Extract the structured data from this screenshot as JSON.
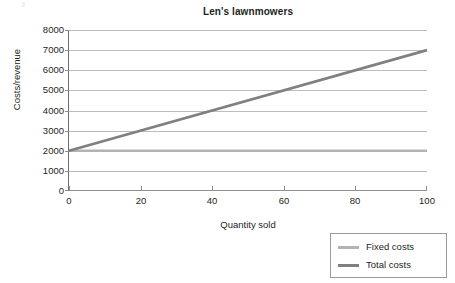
{
  "chart_data": {
    "type": "line",
    "title": "Len's lawnmowers",
    "xlabel": "Quantity sold",
    "ylabel": "Costs/revenue",
    "xlim": [
      0,
      100
    ],
    "ylim": [
      0,
      8000
    ],
    "xticks": [
      0,
      20,
      40,
      60,
      80,
      100
    ],
    "yticks": [
      0,
      1000,
      2000,
      3000,
      4000,
      5000,
      6000,
      7000,
      8000
    ],
    "xtick_labels": [
      "0",
      "20",
      "40",
      "60",
      "80",
      "100"
    ],
    "ytick_labels": [
      "0",
      "1000",
      "2000",
      "3000",
      "4000",
      "5000",
      "6000",
      "7000",
      "8000"
    ],
    "grid": "horizontal",
    "legend_position": "bottom-right-outside",
    "x": [
      0,
      100
    ],
    "series": [
      {
        "name": "Fixed costs",
        "values": [
          2000,
          2000
        ],
        "color": "#b3b3b3"
      },
      {
        "name": "Total costs",
        "values": [
          2000,
          7000
        ],
        "color": "#808080"
      }
    ]
  },
  "legend": {
    "items": [
      {
        "label": "Fixed costs",
        "color": "#b3b3b3"
      },
      {
        "label": "Total costs",
        "color": "#808080"
      }
    ]
  },
  "colors": {
    "fixed_costs": "#b3b3b3",
    "total_costs": "#808080",
    "gridline": "#bcbcbc",
    "axis": "#6d6d6d",
    "text": "#231f20",
    "legend_border": "#9a9a9a",
    "background": "#ffffff"
  }
}
